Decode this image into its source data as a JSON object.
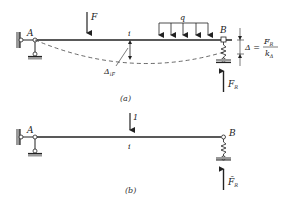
{
  "figure_a": {
    "caption": "(a)",
    "support_a_label": "A",
    "support_b_label": "B",
    "point_load_label": "F",
    "distributed_load_label": "q",
    "point_i_label": "i",
    "deflection_label": "Δ",
    "deflection_sub": "iF",
    "settlement_label": "Δ =",
    "settlement_num": "F",
    "settlement_num_sub": "R",
    "settlement_den": "k",
    "settlement_den_sub": "Δ",
    "reaction_label": "F",
    "reaction_sub": "R"
  },
  "figure_b": {
    "caption": "(b)",
    "support_a_label": "A",
    "support_b_label": "B",
    "unit_load_label": "1",
    "point_i_label": "i",
    "reaction_label": "F̄",
    "reaction_sub": "R"
  },
  "colors": {
    "line": "#222222",
    "hatch": "#888888"
  }
}
